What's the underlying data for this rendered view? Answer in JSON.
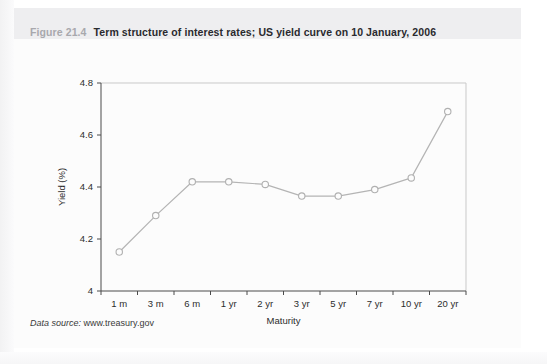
{
  "figure": {
    "number_label": "Figure 21.4",
    "title": "Term structure of interest rates; US yield curve on 10 January, 2006",
    "source_label": "Data source:",
    "source_value": "www.treasury.gov"
  },
  "chart_data": {
    "type": "line",
    "title": "Term structure of interest rates; US yield curve on 10 January, 2006",
    "xlabel": "Maturity",
    "ylabel": "Yield (%)",
    "categories": [
      "1 m",
      "3 m",
      "6 m",
      "1 yr",
      "2 yr",
      "3 yr",
      "5 yr",
      "7 yr",
      "10 yr",
      "20 yr"
    ],
    "values": [
      4.15,
      4.29,
      4.42,
      4.42,
      4.41,
      4.365,
      4.365,
      4.39,
      4.435,
      4.69
    ],
    "ylim": [
      4,
      4.8
    ],
    "yticks": [
      "4",
      "4.2",
      "4.4",
      "4.6",
      "4.8"
    ],
    "ytick_values": [
      4,
      4.2,
      4.4,
      4.6,
      4.8
    ],
    "grid": false,
    "legend": "none",
    "marker": "open-circle",
    "series_color": "#b4b4b4"
  }
}
